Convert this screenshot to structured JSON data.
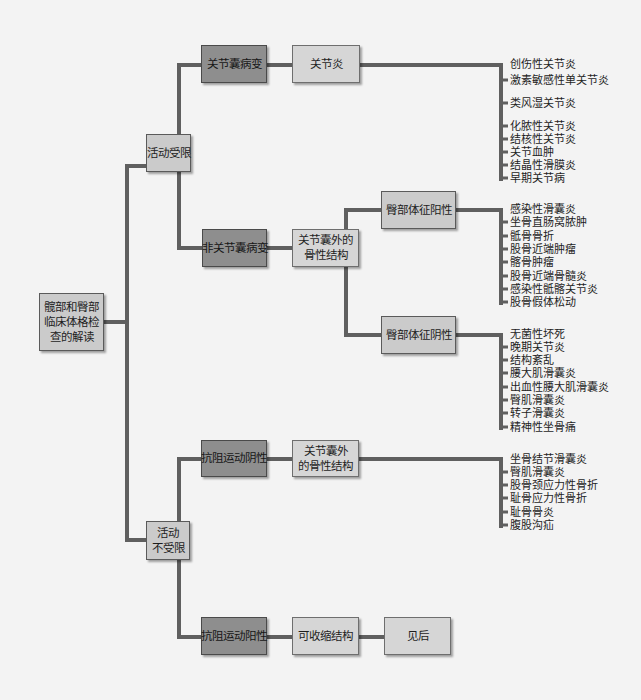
{
  "colors": {
    "background": "#f3f3f3",
    "connector": "#5f5f5f",
    "dark_box": "#8e8e8e",
    "medium_box": "#cbcbcb",
    "light_box": "#d6d6d6"
  },
  "root": {
    "lines": [
      "髋部和臀部",
      "临床体格检",
      "查的解读"
    ]
  },
  "restricted": {
    "label": "活动受限",
    "capsular": {
      "label": "关节囊病变",
      "next": {
        "label": "关节炎",
        "items": [
          "创伤性关节炎",
          "激素敏感性单关节炎",
          "类风湿关节炎",
          "化脓性关节炎",
          "结核性关节炎",
          "关节血肿",
          "结晶性滑膜炎",
          "早期关节病"
        ]
      }
    },
    "noncapsular": {
      "label": "非关节囊病变",
      "next": {
        "lines": [
          "关节囊外的",
          "骨性结构"
        ],
        "positive": {
          "label": "臀部体征阳性",
          "items": [
            "感染性滑囊炎",
            "坐骨直肠窝脓肿",
            "骶骨骨折",
            "股骨近端肿瘤",
            "髂骨肿瘤",
            "股骨近端骨髓炎",
            "感染性骶髂关节炎",
            "股骨假体松动"
          ]
        },
        "negative": {
          "label": "臀部体征阴性",
          "items": [
            "无菌性坏死",
            "晚期关节炎",
            "结构紊乱",
            "腰大肌滑囊炎",
            "出血性腰大肌滑囊炎",
            "臀肌滑囊炎",
            "转子滑囊炎",
            "精神性坐骨痛"
          ]
        }
      }
    }
  },
  "unrestricted": {
    "lines": [
      "活动",
      "不受限"
    ],
    "resisted_negative": {
      "label": "抗阻运动阴性",
      "next": {
        "lines": [
          "关节囊外",
          "的骨性结构"
        ],
        "items": [
          "坐骨结节滑囊炎",
          "臀肌滑囊炎",
          "股骨颈应力性骨折",
          "耻骨应力性骨折",
          "耻骨骨炎",
          "腹股沟疝"
        ]
      }
    },
    "resisted_positive": {
      "label": "抗阻运动阳性",
      "next": {
        "label": "可收缩结构",
        "next": {
          "label": "见后"
        }
      }
    }
  }
}
